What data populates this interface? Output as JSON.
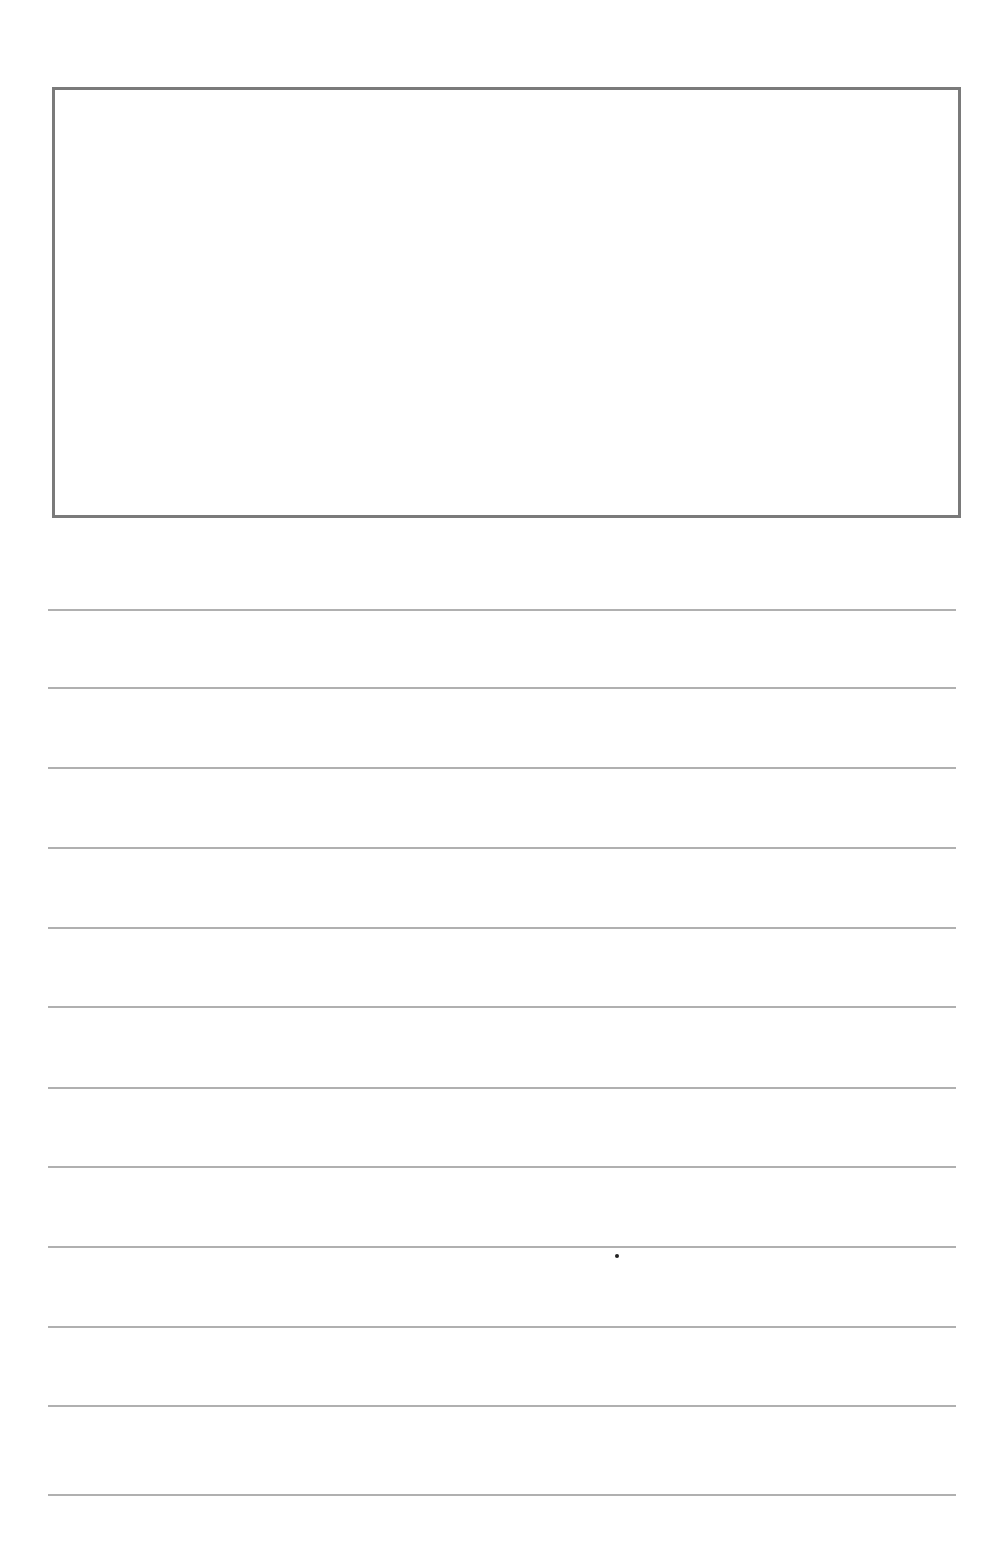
{
  "page": {
    "type": "blank writing sheet",
    "drawing_box": {
      "label": "",
      "border_color": "#7a7a7a"
    },
    "ruled_lines": {
      "count": 12,
      "color": "#b0b0b0",
      "y_positions": [
        609,
        687,
        767,
        847,
        927,
        1006,
        1087,
        1166,
        1246,
        1326,
        1405,
        1494
      ]
    },
    "marks": [
      {
        "type": "dot",
        "x": 617,
        "y": 1256
      }
    ]
  }
}
